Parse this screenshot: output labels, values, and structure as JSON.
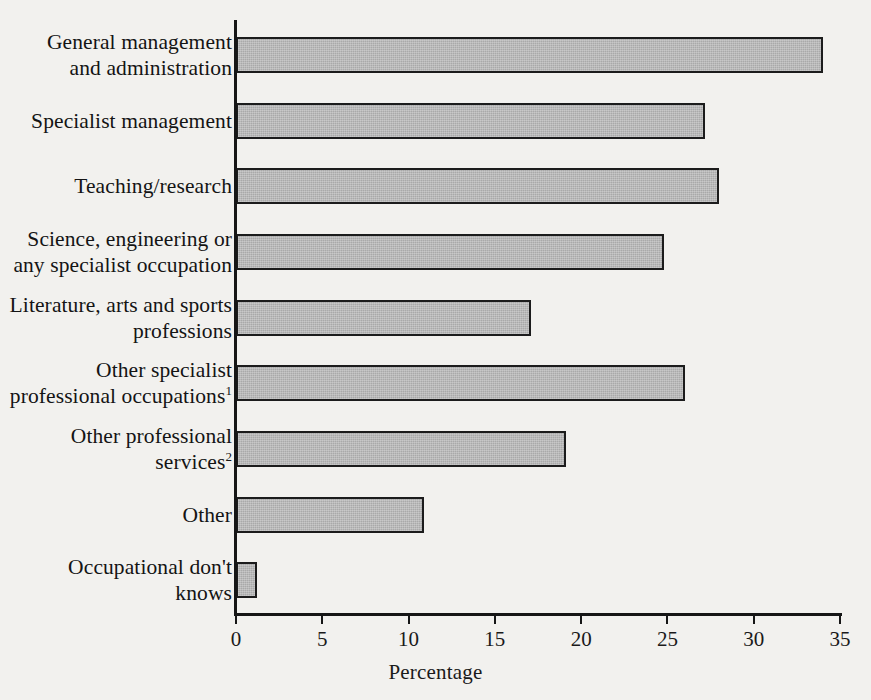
{
  "chart_data": {
    "type": "bar",
    "orientation": "horizontal",
    "title": "",
    "xlabel": "Percentage",
    "ylabel": "",
    "xlim": [
      0,
      35
    ],
    "xticks": [
      0,
      5,
      10,
      15,
      20,
      25,
      30,
      35
    ],
    "xtick_labels": [
      "0",
      "5",
      "10",
      "15",
      "20",
      "25",
      "30",
      "35"
    ],
    "grid": false,
    "legend": false,
    "categories": [
      "General management and administration",
      "Specialist management",
      "Teaching/research",
      "Science, engineering or any specialist occupation",
      "Literature, arts and sports professions",
      "Other specialist professional occupations",
      "Other professional services",
      "Other",
      "Occupational don't knows"
    ],
    "values": [
      34.0,
      27.2,
      28.0,
      24.8,
      17.1,
      26.0,
      19.1,
      10.9,
      1.2
    ],
    "bar_color": "#a9a9a9",
    "bar_edge_color": "#1c1c1c"
  },
  "axis": {
    "x_title": "Percentage",
    "ticks": [
      {
        "value": 0,
        "label": "0"
      },
      {
        "value": 5,
        "label": "5"
      },
      {
        "value": 10,
        "label": "10"
      },
      {
        "value": 15,
        "label": "15"
      },
      {
        "value": 20,
        "label": "20"
      },
      {
        "value": 25,
        "label": "25"
      },
      {
        "value": 30,
        "label": "30"
      },
      {
        "value": 35,
        "label": "35"
      }
    ]
  },
  "categories": [
    {
      "line1": "General management",
      "line2": "and administration",
      "footnote": "",
      "value": 34.0
    },
    {
      "line1": "Specialist management",
      "line2": "",
      "footnote": "",
      "value": 27.2
    },
    {
      "line1": "Teaching/research",
      "line2": "",
      "footnote": "",
      "value": 28.0
    },
    {
      "line1": "Science, engineering or",
      "line2": "any specialist occupation",
      "footnote": "",
      "value": 24.8
    },
    {
      "line1": "Literature, arts and sports",
      "line2": "professions",
      "footnote": "",
      "value": 17.1
    },
    {
      "line1": "Other specialist",
      "line2": "professional occupations",
      "footnote": "1",
      "value": 26.0
    },
    {
      "line1": "Other professional",
      "line2": "services",
      "footnote": "2",
      "value": 19.1
    },
    {
      "line1": "Other",
      "line2": "",
      "footnote": "",
      "value": 10.9
    },
    {
      "line1": "Occupational don't",
      "line2": "knows",
      "footnote": "",
      "value": 1.2
    }
  ],
  "colors": {
    "background": "#f2f1ee",
    "ink": "#1a1a1a",
    "bar_fill": "#a9a9a9",
    "bar_edge": "#1c1c1c"
  }
}
